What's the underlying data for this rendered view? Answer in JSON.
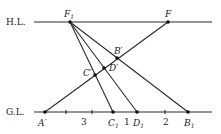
{
  "diagram": {
    "title": "",
    "lines": {
      "horizon": {
        "label": "H.L.",
        "y": 22,
        "x1": 34,
        "x2": 212
      },
      "ground": {
        "label": "G.L.",
        "y": 112,
        "x1": 34,
        "x2": 212
      }
    },
    "points": {
      "F1": {
        "label": "F",
        "sub": "1",
        "x": 70,
        "y": 22
      },
      "F": {
        "label": "F",
        "sub": "",
        "x": 168,
        "y": 22
      },
      "A_prime": {
        "label": "A′",
        "x": 45,
        "y": 112
      },
      "C1": {
        "label": "C",
        "sub": "1",
        "x": 113,
        "y": 112
      },
      "D1": {
        "label": "D",
        "sub": "1",
        "x": 137,
        "y": 112
      },
      "B1": {
        "label": "B",
        "sub": "1",
        "x": 188,
        "y": 112
      },
      "B_prime": {
        "label": "B′",
        "x": 117,
        "y": 58
      },
      "D_prime": {
        "label": "D′",
        "x": 104,
        "y": 68
      },
      "C_prime": {
        "label": "C′",
        "x": 95,
        "y": 75
      }
    },
    "ground_labels": [
      {
        "text": "3",
        "x": 83
      },
      {
        "text": "1",
        "x": 126
      },
      {
        "text": "2",
        "x": 166
      }
    ],
    "ticks": [
      66,
      92,
      165
    ]
  }
}
